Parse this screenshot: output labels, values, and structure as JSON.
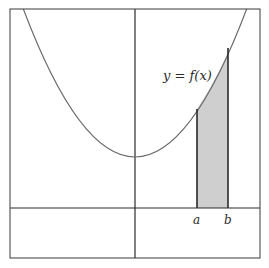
{
  "figure": {
    "curve_label": "y = f(x)",
    "label_a": "a",
    "label_b": "b",
    "colors": {
      "background": "#ffffff",
      "frame": "#3a3a3a",
      "axes": "#2a2a2a",
      "curve": "#6a6a6a",
      "shaded_region": "#cfcfcf",
      "bounds": "#2a2a2a"
    }
  }
}
